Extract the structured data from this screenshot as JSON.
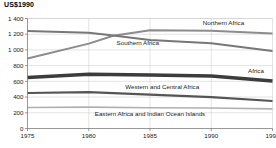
{
  "chart_data": {
    "type": "line",
    "title": "US$1990",
    "subtitle": "",
    "xlabel": "",
    "ylabel": "US$1990",
    "x": [
      1975,
      1980,
      1985,
      1990,
      1995
    ],
    "xlim": [
      1975,
      1995
    ],
    "ylim": [
      0,
      1400
    ],
    "yticks": [
      0,
      200,
      400,
      600,
      800,
      1000,
      1200,
      1400
    ],
    "ytick_labels": [
      "0",
      "200",
      "400",
      "600",
      "800",
      "1 000",
      "1 200",
      "1 400"
    ],
    "xticks": [
      1975,
      1980,
      1985,
      1990,
      1995
    ],
    "xtick_labels": [
      "1975",
      "1980",
      "1985",
      "1990",
      "1995"
    ],
    "grid": true,
    "grid_axis": "y",
    "legend": "inline-labels",
    "series": [
      {
        "name": "Northern Africa",
        "label": "Northern Africa",
        "color": "#8c8c8c",
        "width": 2.0,
        "x": [
          1975,
          1980,
          1982,
          1985,
          1990,
          1995
        ],
        "values": [
          890,
          1080,
          1180,
          1250,
          1245,
          1210
        ],
        "label_x": 1991.0,
        "label_y": 1320,
        "label_anchor": "middle"
      },
      {
        "name": "Southern Africa",
        "label": "Southern Africa",
        "color": "#777777",
        "width": 2.0,
        "x": [
          1975,
          1980,
          1982,
          1985,
          1990,
          1995
        ],
        "values": [
          1240,
          1220,
          1185,
          1125,
          1085,
          985
        ],
        "label_x": 1984.0,
        "label_y": 1060,
        "label_anchor": "middle"
      },
      {
        "name": "Africa",
        "label": "Africa",
        "color": "#3c3c3c",
        "width": 3.4,
        "x": [
          1975,
          1980,
          1985,
          1990,
          1995
        ],
        "values": [
          650,
          690,
          680,
          668,
          605
        ],
        "label_x": 1994.3,
        "label_y": 712,
        "label_anchor": "end"
      },
      {
        "name": "Western and Central Africa",
        "label": "Western and Central Africa",
        "color": "#555555",
        "width": 2.2,
        "x": [
          1975,
          1980,
          1985,
          1990,
          1995
        ],
        "values": [
          452,
          462,
          430,
          400,
          350
        ],
        "label_x": 1986.0,
        "label_y": 500,
        "label_anchor": "middle"
      },
      {
        "name": "Eastern Africa and Indian Ocean Islands",
        "label": "Eastern Africa and Indian Ocean Islands",
        "color": "#b0b0b0",
        "width": 1.6,
        "x": [
          1975,
          1980,
          1985,
          1990,
          1995
        ],
        "values": [
          268,
          272,
          265,
          260,
          250
        ],
        "label_x": 1985.0,
        "label_y": 160,
        "label_anchor": "middle"
      }
    ]
  }
}
